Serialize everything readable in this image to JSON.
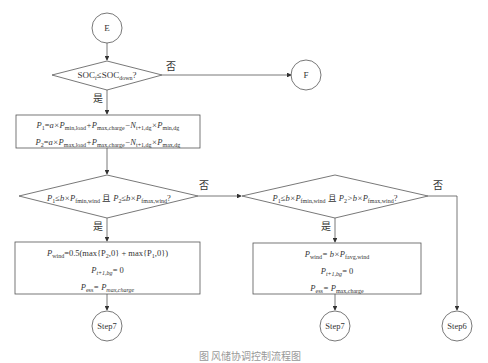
{
  "nodes": {
    "start": {
      "label": "E"
    },
    "exit_f": {
      "label": "F"
    },
    "decision1": {
      "condition": "SOC_t ≤ SOC_down ?",
      "parts": {
        "a": "SOC",
        "a_sub": "t",
        "op": "≤",
        "b": "SOC",
        "b_sub": "down",
        "q": "?"
      }
    },
    "process1": {
      "line1": {
        "lhs": "P",
        "lhs_sub": "1",
        "eq": "=",
        "t1": "a×P",
        "t1_sub": "min,load",
        "t2": "+P",
        "t2_sub": "max,charge",
        "t3": "−N",
        "t3_sub": "t+1,dg",
        "t4": "×P",
        "t4_sub": "min,dg"
      },
      "line2": {
        "lhs": "P",
        "lhs_sub": "2",
        "eq": "=",
        "t1": "a×P",
        "t1_sub": "max,load",
        "t2": "+P",
        "t2_sub": "max,charge",
        "t3": "−N",
        "t3_sub": "t+1,dg",
        "t4": "×P",
        "t4_sub": "max,dg"
      }
    },
    "decision2": {
      "p1": "P",
      "p1_sub": "1",
      "op1": "≤b×P",
      "s1": "fmin,wind",
      "and": " 且 ",
      "p2": "P",
      "p2_sub": "2",
      "op2": "≤b×P",
      "s2": "fmax,wind",
      "q": "?"
    },
    "decision3": {
      "p1": "P",
      "p1_sub": "1",
      "op1": "≤b×P",
      "s1": "fmin,wind",
      "and": " 且 ",
      "p2": "P",
      "p2_sub": "2",
      "op2": ">b×P",
      "s2": "fmax,wind",
      "q": "?"
    },
    "process2": {
      "line1": {
        "lhs": "P",
        "lhs_sub": "wind",
        "rhs": "=0.5(max{P",
        "s1": "2",
        "mid": ",0} + max{P",
        "s2": "1",
        "end": ",0})"
      },
      "line2": {
        "lhs": "P",
        "lhs_sub": "t+1,bg",
        "rhs": "= 0"
      },
      "line3": {
        "lhs": "P",
        "lhs_sub": "ess",
        "rhs": "= P",
        "rhs_sub": "max,charge"
      }
    },
    "process3": {
      "line1": {
        "lhs": "P",
        "lhs_sub": "wind",
        "rhs": "= b×P",
        "rhs_sub": "favg,wind"
      },
      "line2": {
        "lhs": "P",
        "lhs_sub": "t+1,bg",
        "rhs": "= 0"
      },
      "line3": {
        "lhs": "P",
        "lhs_sub": "ess",
        "rhs": "= P",
        "rhs_sub": "max,charge"
      }
    },
    "end_step7_a": {
      "label": "Step7"
    },
    "end_step7_b": {
      "label": "Step7"
    },
    "end_step6": {
      "label": "Step6"
    }
  },
  "edge_labels": {
    "yes": "是",
    "no": "否"
  },
  "caption": "图  风储协调控制流程图"
}
